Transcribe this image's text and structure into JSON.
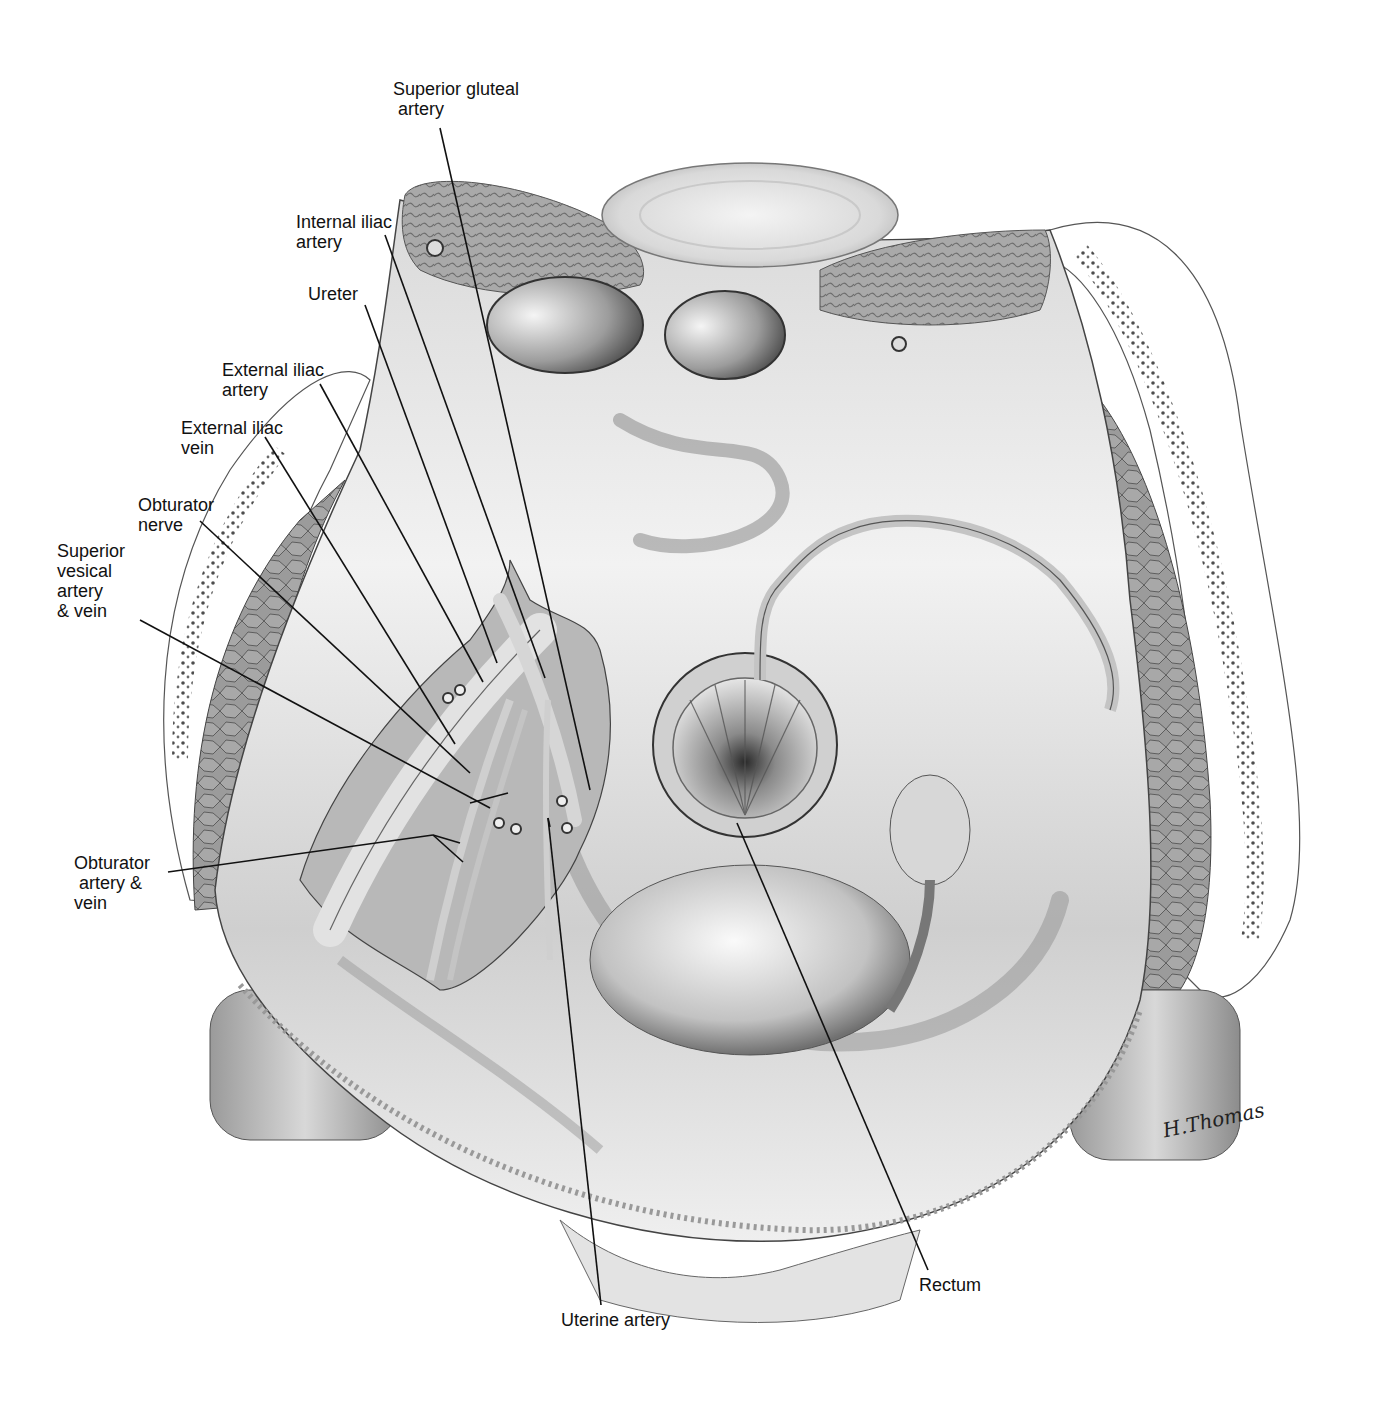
{
  "figure": {
    "type": "anatomical illustration",
    "view": "pelvis, superior view, grayscale",
    "signature": "H.Thomas"
  },
  "labels": [
    {
      "id": "superior-gluteal-artery",
      "text": "Superior gluteal\n artery",
      "x": 393,
      "y": 79,
      "align": "left",
      "leader": [
        [
          440,
          128
        ],
        [
          590,
          790
        ]
      ]
    },
    {
      "id": "internal-iliac-artery",
      "text": "Internal iliac\nartery",
      "x": 296,
      "y": 212,
      "align": "left",
      "leader": [
        [
          385,
          235
        ],
        [
          545,
          678
        ]
      ]
    },
    {
      "id": "ureter",
      "text": "Ureter",
      "x": 308,
      "y": 284,
      "align": "left",
      "leader": [
        [
          365,
          305
        ],
        [
          497,
          663
        ]
      ]
    },
    {
      "id": "external-iliac-artery",
      "text": "External iliac\nartery",
      "x": 222,
      "y": 360,
      "align": "left",
      "leader": [
        [
          320,
          384
        ],
        [
          483,
          682
        ]
      ]
    },
    {
      "id": "external-iliac-vein",
      "text": "External iliac\nvein",
      "x": 181,
      "y": 418,
      "align": "left",
      "leader": [
        [
          265,
          437
        ],
        [
          455,
          744
        ]
      ]
    },
    {
      "id": "obturator-nerve",
      "text": "Obturator\nnerve",
      "x": 138,
      "y": 495,
      "align": "left",
      "leader": [
        [
          200,
          521
        ],
        [
          470,
          773
        ]
      ]
    },
    {
      "id": "superior-vesical-artery-vein",
      "text": "Superior\nvesical\nartery\n& vein",
      "x": 57,
      "y": 541,
      "align": "left",
      "leader": [
        [
          140,
          620
        ],
        [
          490,
          808
        ]
      ],
      "leader2": [
        [
          470,
          803
        ],
        [
          508,
          793
        ]
      ]
    },
    {
      "id": "obturator-artery-vein",
      "text": "Obturator\n artery &\nvein",
      "x": 74,
      "y": 853,
      "align": "left",
      "leader": [
        [
          168,
          872
        ],
        [
          433,
          835
        ]
      ],
      "leader2": [
        [
          433,
          835
        ],
        [
          460,
          843
        ]
      ],
      "leader3": [
        [
          433,
          835
        ],
        [
          463,
          862
        ]
      ]
    },
    {
      "id": "uterine-artery",
      "text": "Uterine artery",
      "x": 561,
      "y": 1310,
      "align": "left",
      "leader": [
        [
          601,
          1305
        ],
        [
          548,
          818
        ]
      ],
      "leader2": [
        [
          548,
          818
        ],
        [
          550,
          827
        ]
      ]
    },
    {
      "id": "rectum",
      "text": "Rectum",
      "x": 919,
      "y": 1275,
      "align": "left",
      "leader": [
        [
          928,
          1270
        ],
        [
          737,
          823
        ]
      ]
    }
  ],
  "colors": {
    "line": "#111111",
    "label": "#111111",
    "tissue_light": "#eeeeee",
    "tissue_mid": "#bdbdbd",
    "tissue_dark": "#6a6a6a",
    "fat_stipple": "#555555"
  }
}
